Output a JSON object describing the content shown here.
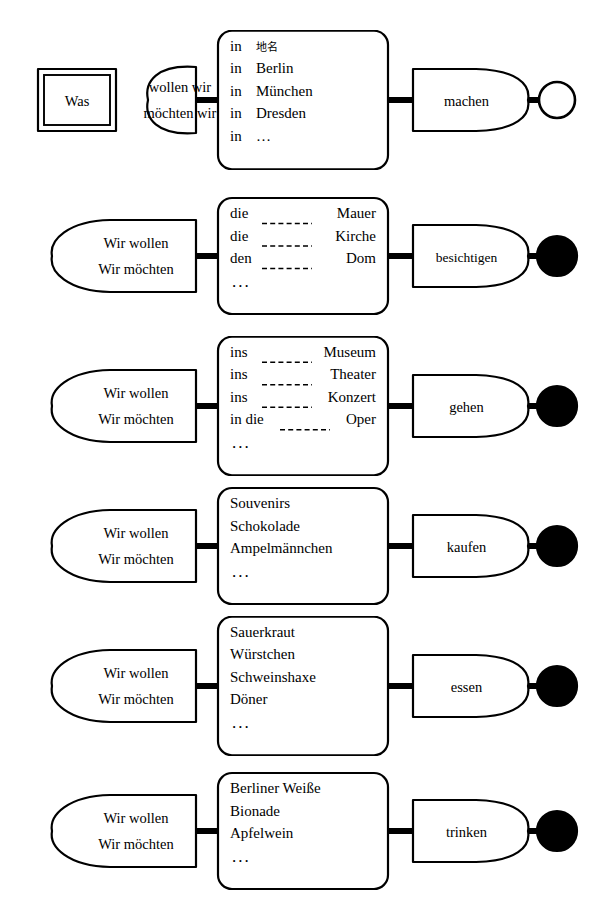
{
  "diagram": {
    "type": "syntax-network",
    "background": "#ffffff",
    "stroke_color": "#000000",
    "rows": [
      {
        "id": "row-was-machen",
        "start": {
          "kind": "double-rect",
          "label": "Was"
        },
        "subject": {
          "kind": "lens",
          "lines": [
            "wollen wir",
            "möchten wir"
          ]
        },
        "options": {
          "kind": "rounded-rect",
          "items": [
            {
              "prefix": "in",
              "blank": false,
              "suffix": "地名",
              "cjk": true
            },
            {
              "prefix": "in",
              "blank": false,
              "suffix": "Berlin",
              "cjk": false
            },
            {
              "prefix": "in",
              "blank": false,
              "suffix": "München",
              "cjk": false
            },
            {
              "prefix": "in",
              "blank": false,
              "suffix": "Dresden",
              "cjk": false
            },
            {
              "prefix": "in",
              "blank": false,
              "suffix": "…",
              "cjk": false
            }
          ],
          "ellipsis": false
        },
        "verb": {
          "kind": "d-shape",
          "label": "machen"
        },
        "end": {
          "kind": "circle-hollow"
        }
      },
      {
        "id": "row-besichtigen",
        "start": null,
        "subject": {
          "kind": "d-shape-left",
          "lines": [
            "Wir wollen",
            "Wir möchten"
          ]
        },
        "options": {
          "kind": "rounded-rect",
          "items": [
            {
              "prefix": "die",
              "blank": true,
              "suffix": "Mauer",
              "cjk": false
            },
            {
              "prefix": "die",
              "blank": true,
              "suffix": "Kirche",
              "cjk": false
            },
            {
              "prefix": "den",
              "blank": true,
              "suffix": "Dom",
              "cjk": false
            }
          ],
          "ellipsis": true
        },
        "verb": {
          "kind": "d-shape",
          "label": "besichtigen"
        },
        "end": {
          "kind": "circle-filled"
        }
      },
      {
        "id": "row-gehen",
        "start": null,
        "subject": {
          "kind": "d-shape-left",
          "lines": [
            "Wir wollen",
            "Wir möchten"
          ]
        },
        "options": {
          "kind": "rounded-rect",
          "items": [
            {
              "prefix": "ins",
              "blank": true,
              "suffix": "Museum",
              "cjk": false
            },
            {
              "prefix": "ins",
              "blank": true,
              "suffix": "Theater",
              "cjk": false
            },
            {
              "prefix": "ins",
              "blank": true,
              "suffix": "Konzert",
              "cjk": false
            },
            {
              "prefix": "in die",
              "blank": true,
              "suffix": "Oper",
              "cjk": false
            }
          ],
          "ellipsis": true
        },
        "verb": {
          "kind": "d-shape",
          "label": "gehen"
        },
        "end": {
          "kind": "circle-filled"
        }
      },
      {
        "id": "row-kaufen",
        "start": null,
        "subject": {
          "kind": "d-shape-left",
          "lines": [
            "Wir wollen",
            "Wir möchten"
          ]
        },
        "options": {
          "kind": "rounded-rect",
          "items": [
            {
              "prefix": "Souvenirs",
              "blank": false,
              "suffix": "",
              "cjk": false
            },
            {
              "prefix": "Schokolade",
              "blank": false,
              "suffix": "",
              "cjk": false
            },
            {
              "prefix": "Ampelmännchen",
              "blank": false,
              "suffix": "",
              "cjk": false
            }
          ],
          "ellipsis": true
        },
        "verb": {
          "kind": "d-shape",
          "label": "kaufen"
        },
        "end": {
          "kind": "circle-filled"
        }
      },
      {
        "id": "row-essen",
        "start": null,
        "subject": {
          "kind": "d-shape-left",
          "lines": [
            "Wir wollen",
            "Wir möchten"
          ]
        },
        "options": {
          "kind": "rounded-rect",
          "items": [
            {
              "prefix": "Sauerkraut",
              "blank": false,
              "suffix": "",
              "cjk": false
            },
            {
              "prefix": "Würstchen",
              "blank": false,
              "suffix": "",
              "cjk": false
            },
            {
              "prefix": "Schweinshaxe",
              "blank": false,
              "suffix": "",
              "cjk": false
            },
            {
              "prefix": "Döner",
              "blank": false,
              "suffix": "",
              "cjk": false
            }
          ],
          "ellipsis": true
        },
        "verb": {
          "kind": "d-shape",
          "label": "essen"
        },
        "end": {
          "kind": "circle-filled"
        }
      },
      {
        "id": "row-trinken",
        "start": null,
        "subject": {
          "kind": "d-shape-left",
          "lines": [
            "Wir wollen",
            "Wir möchten"
          ]
        },
        "options": {
          "kind": "rounded-rect",
          "items": [
            {
              "prefix": "Berliner Weiße",
              "blank": false,
              "suffix": "",
              "cjk": false
            },
            {
              "prefix": "Bionade",
              "blank": false,
              "suffix": "",
              "cjk": false
            },
            {
              "prefix": "Apfelwein",
              "blank": false,
              "suffix": "",
              "cjk": false
            }
          ],
          "ellipsis": true
        },
        "verb": {
          "kind": "d-shape",
          "label": "trinken"
        },
        "end": {
          "kind": "circle-filled"
        }
      }
    ],
    "ellipsis_glyph": "..."
  }
}
